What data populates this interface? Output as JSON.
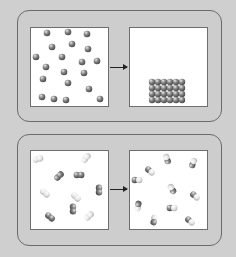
{
  "colors": {
    "background": "#cfcfcf",
    "panel_border": "#6a6a6a",
    "box_fill": "#ffffff",
    "box_border": "#6e6e6e",
    "dark_atom": "#6f6f6f",
    "light_atom": "#e4e4e4",
    "arrow": "#222222"
  },
  "top_panel": {
    "description": "gas particles condensing into solid lattice",
    "before": {
      "atoms": [
        [
          47,
          33
        ],
        [
          68,
          32
        ],
        [
          87,
          34
        ],
        [
          52,
          47
        ],
        [
          72,
          44
        ],
        [
          88,
          49
        ],
        [
          36,
          57
        ],
        [
          62,
          57
        ],
        [
          82,
          62
        ],
        [
          97,
          61
        ],
        [
          46,
          67
        ],
        [
          64,
          72
        ],
        [
          84,
          73
        ],
        [
          43,
          79
        ],
        [
          68,
          83
        ],
        [
          89,
          89
        ],
        [
          42,
          97
        ],
        [
          54,
          99
        ],
        [
          66,
          100
        ],
        [
          100,
          99
        ]
      ]
    },
    "after": {
      "lattice": {
        "columns": 6,
        "rows": 4,
        "origin": [
          152,
          82
        ],
        "spacing": 6
      }
    }
  },
  "bottom_panel": {
    "description": "diatomic molecules exchanging atoms",
    "before": {
      "molecules": [
        {
          "x": 38,
          "y": 159,
          "angle": -15,
          "a": "light",
          "b": "light"
        },
        {
          "x": 86,
          "y": 158,
          "angle": -50,
          "a": "light",
          "b": "light"
        },
        {
          "x": 59,
          "y": 176,
          "angle": -45,
          "a": "dark",
          "b": "dark"
        },
        {
          "x": 79,
          "y": 175,
          "angle": 0,
          "a": "dark",
          "b": "dark"
        },
        {
          "x": 99,
          "y": 190,
          "angle": 90,
          "a": "dark",
          "b": "dark"
        },
        {
          "x": 45,
          "y": 193,
          "angle": 40,
          "a": "light",
          "b": "light"
        },
        {
          "x": 76,
          "y": 197,
          "angle": 45,
          "a": "light",
          "b": "light"
        },
        {
          "x": 73,
          "y": 209,
          "angle": 90,
          "a": "dark",
          "b": "dark"
        },
        {
          "x": 50,
          "y": 217,
          "angle": 40,
          "a": "dark",
          "b": "dark"
        },
        {
          "x": 89,
          "y": 216,
          "angle": -45,
          "a": "light",
          "b": "light"
        }
      ]
    },
    "after": {
      "molecules": [
        {
          "x": 167,
          "y": 159,
          "angle": -110,
          "a": "dark",
          "b": "light"
        },
        {
          "x": 193,
          "y": 163,
          "angle": -70,
          "a": "dark",
          "b": "light"
        },
        {
          "x": 150,
          "y": 171,
          "angle": 40,
          "a": "dark",
          "b": "light"
        },
        {
          "x": 137,
          "y": 180,
          "angle": 0,
          "a": "dark",
          "b": "light"
        },
        {
          "x": 172,
          "y": 189,
          "angle": -120,
          "a": "dark",
          "b": "light"
        },
        {
          "x": 195,
          "y": 196,
          "angle": 40,
          "a": "dark",
          "b": "light"
        },
        {
          "x": 138,
          "y": 206,
          "angle": -80,
          "a": "light",
          "b": "dark"
        },
        {
          "x": 172,
          "y": 208,
          "angle": 0,
          "a": "dark",
          "b": "light"
        },
        {
          "x": 154,
          "y": 220,
          "angle": 100,
          "a": "light",
          "b": "dark"
        },
        {
          "x": 190,
          "y": 221,
          "angle": 40,
          "a": "dark",
          "b": "light"
        }
      ]
    }
  }
}
